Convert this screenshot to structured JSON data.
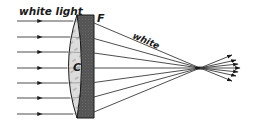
{
  "diagram": {
    "labels": {
      "incoming": "white light",
      "flint_lens": "F",
      "crown_lens": "C",
      "outgoing": "white"
    },
    "rays": {
      "count": 7,
      "entry_y": [
        21,
        37,
        52,
        68,
        83,
        98,
        114
      ],
      "focal_point": [
        200,
        68
      ],
      "color": "#3a3a3a"
    },
    "colors": {
      "crown_lens_fill": "#d9d9d9",
      "flint_lens_fill": "#555555",
      "outline": "#1a1a1a",
      "background": "#ffffff"
    }
  }
}
